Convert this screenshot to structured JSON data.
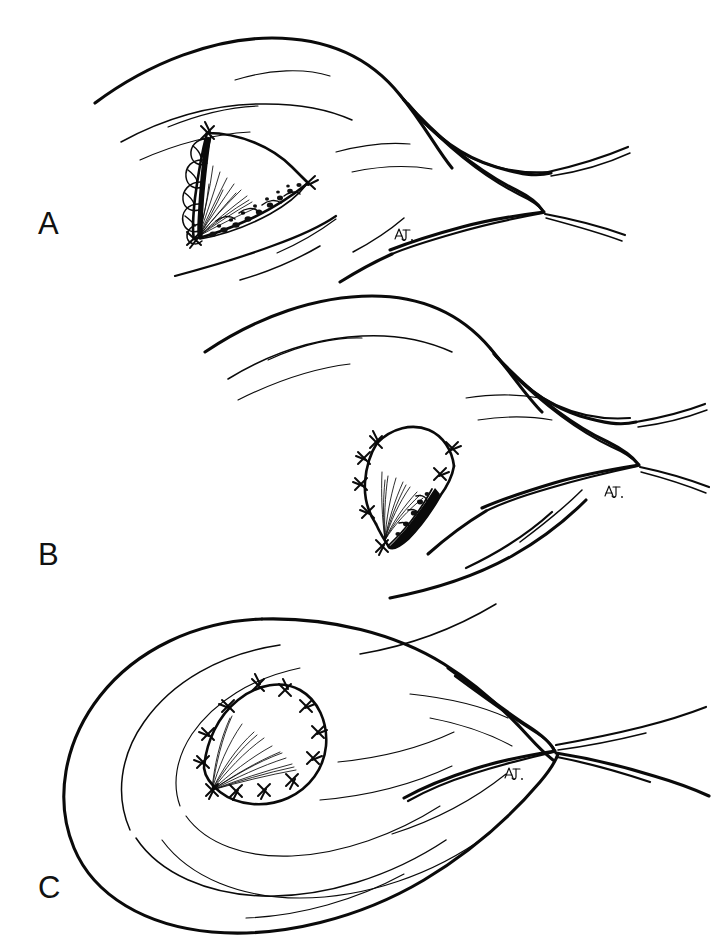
{
  "figure": {
    "medium": "pen-and-ink line drawing",
    "background_color": "#ffffff",
    "ink_color": "#0a0a0a",
    "panel_count": 3
  },
  "panels": [
    {
      "id": "A",
      "label": "A",
      "label_position": {
        "x": 38,
        "y": 208
      },
      "caption": "Open eyelid defect with lobulated tissue margin and exposed wound bed",
      "stage": "pre-closure",
      "signature": "A.J.",
      "signature_position": {
        "x": 399,
        "y": 233
      },
      "wound": {
        "state": "open",
        "suture_count": 3,
        "has_fan_hatching": true,
        "has_lobulated_margin": true,
        "has_stippled_margin": true
      }
    },
    {
      "id": "B",
      "label": "B",
      "label_position": {
        "x": 38,
        "y": 539
      },
      "caption": "Partial closure; advancement flap sutured along superior and medial margins",
      "stage": "partial-closure",
      "signature": "A.J.",
      "signature_position": {
        "x": 609,
        "y": 490
      },
      "wound": {
        "state": "partially-closed",
        "suture_count": 7,
        "has_fan_hatching": true,
        "has_residual_defect": true
      }
    },
    {
      "id": "C",
      "label": "C",
      "label_position": {
        "x": 38,
        "y": 872
      },
      "caption": "Complete closure with circumferential interrupted sutures; eyelid edematous",
      "stage": "complete-closure",
      "signature": "A.J.",
      "signature_position": {
        "x": 509,
        "y": 772
      },
      "wound": {
        "state": "closed",
        "suture_count": 12,
        "has_fan_hatching": true,
        "has_residual_defect": false
      }
    }
  ],
  "labels": {
    "a": "A",
    "b": "B",
    "c": "C"
  },
  "signature": {
    "text": "A.J.",
    "description": "artist initials in cursive, repeated once per panel"
  }
}
